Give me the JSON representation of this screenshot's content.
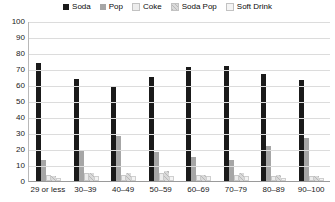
{
  "chart_data": {
    "type": "bar",
    "title": "",
    "xlabel": "",
    "ylabel": "",
    "ylim": [
      0,
      100
    ],
    "ytick_step": 10,
    "grid": true,
    "legend_position": "top-center",
    "categories": [
      "29 or less",
      "30–39",
      "40–49",
      "50–59",
      "60–69",
      "70–79",
      "80–89",
      "90–100"
    ],
    "yticks": [
      "100",
      "90",
      "80",
      "70",
      "60",
      "50",
      "40",
      "30",
      "20",
      "10",
      "0"
    ],
    "series": [
      {
        "name": "Soda",
        "color": "#1a1a1a",
        "values": [
          74,
          64,
          59,
          65,
          71,
          72,
          67,
          63
        ]
      },
      {
        "name": "Pop",
        "color": "#a6a6a6",
        "values": [
          13,
          19,
          28,
          18,
          15,
          13,
          22,
          27
        ]
      },
      {
        "name": "Coke",
        "color": "#ededed",
        "values": [
          4,
          5,
          4,
          5,
          4,
          4,
          3,
          3
        ]
      },
      {
        "name": "Soda Pop",
        "color": "#d9d9d9",
        "values": [
          3,
          5,
          5,
          6,
          4,
          5,
          4,
          3
        ]
      },
      {
        "name": "Soft Drink",
        "color": "#f4f4f4",
        "values": [
          2,
          3,
          3,
          3,
          3,
          3,
          2,
          2
        ]
      }
    ]
  }
}
